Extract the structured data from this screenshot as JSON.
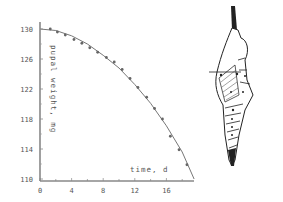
{
  "chart_data": {
    "type": "scatter",
    "title": "",
    "xlabel": "time, d",
    "ylabel": "pupal weight, mg",
    "xlim": [
      0,
      19.5
    ],
    "ylim": [
      110,
      131
    ],
    "x_ticks": [
      0,
      4,
      8,
      12,
      16
    ],
    "x_tick_labels": [
      "0",
      "4",
      "8",
      "12",
      "16"
    ],
    "y_ticks": [
      110,
      114,
      118,
      122,
      126,
      130
    ],
    "y_tick_labels": [
      "110",
      "114",
      "118",
      "122",
      "126",
      "130"
    ],
    "grid": false,
    "legend": null,
    "series": [
      {
        "name": "measured",
        "marker": "circle",
        "x": [
          1.3,
          2.2,
          3.2,
          4.3,
          5.3,
          6.3,
          7.3,
          8.4,
          9.4,
          10.4,
          11.4,
          12.4,
          13.5,
          14.5,
          15.5,
          16.5,
          17.6,
          18.6
        ],
        "values": [
          130.0,
          129.6,
          129.2,
          128.6,
          128.1,
          127.5,
          126.9,
          126.2,
          125.6,
          124.6,
          123.4,
          122.2,
          120.9,
          119.4,
          118.0,
          115.7,
          113.9,
          111.9
        ]
      },
      {
        "name": "fitted curve",
        "marker": "line",
        "x": [
          0,
          2,
          4,
          6,
          8,
          10,
          12,
          14,
          16,
          18,
          19.5
        ],
        "values": [
          130.0,
          129.8,
          129.1,
          128.0,
          126.5,
          124.8,
          122.6,
          120.1,
          117.1,
          113.6,
          110.0
        ]
      }
    ]
  },
  "illustration": {
    "subject": "pupa drawing"
  }
}
